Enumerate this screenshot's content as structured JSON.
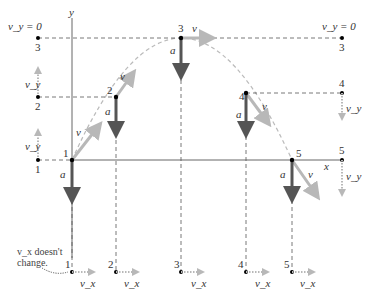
{
  "axes": {
    "x_label": "x",
    "y_label": "y"
  },
  "vector_labels": {
    "velocity": "v⃗",
    "acceleration": "a⃗"
  },
  "points": [
    {
      "id": "1",
      "label": "1"
    },
    {
      "id": "2",
      "label": "2"
    },
    {
      "id": "3",
      "label": "3"
    },
    {
      "id": "4",
      "label": "4"
    },
    {
      "id": "5",
      "label": "5"
    }
  ],
  "left_column": {
    "vy_zero_label": "v_y = 0",
    "vy_label": "v_y",
    "points": [
      "3",
      "2",
      "1"
    ]
  },
  "right_column": {
    "vy_zero_label": "v_y = 0",
    "vy_label": "v_y",
    "points": [
      "3",
      "4",
      "5"
    ]
  },
  "bottom_row": {
    "vx_label": "v_x",
    "points": [
      "1",
      "2",
      "3",
      "4",
      "5"
    ],
    "annotation_line1": "v_x doesn't",
    "annotation_line2": "change."
  },
  "colors": {
    "axis": "#555555",
    "acceleration": "#555555",
    "velocity": "#b3b3b3",
    "trajectory": "#b3b3b3",
    "dashed": "#555555",
    "point": "#000000"
  }
}
